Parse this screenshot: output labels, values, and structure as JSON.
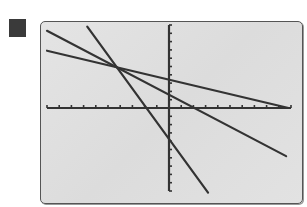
{
  "marker": {
    "icon": "filled-square-icon",
    "color": "#3a3a3a"
  },
  "screen": {
    "background": "#e0e0e0",
    "border": "#555555"
  },
  "chart_data": {
    "type": "line",
    "title": "",
    "xlabel": "",
    "ylabel": "",
    "xlim": [
      -10,
      10
    ],
    "ylim": [
      -10,
      10
    ],
    "x_tick_step": 1,
    "y_tick_step": 1,
    "grid": false,
    "legend": null,
    "line_color": "#333333",
    "series": [
      {
        "name": "line 1 (steepest)",
        "x": [
          -6.7,
          3.2
        ],
        "y": [
          9.8,
          -10.2
        ],
        "y_intercept": -2.3,
        "x_intercept": -1.1
      },
      {
        "name": "line 2",
        "x": [
          -10,
          9.6
        ],
        "y": [
          9.3,
          -5.8
        ],
        "y_intercept": 2.5,
        "x_intercept": 1.9
      },
      {
        "name": "line 3 (shallowest)",
        "x": [
          -10,
          9.8
        ],
        "y": [
          6.9,
          0
        ],
        "y_intercept": 1.4,
        "x_intercept": 9.8
      }
    ],
    "common_intersection": {
      "x": -4.1,
      "y": 4.7
    }
  }
}
